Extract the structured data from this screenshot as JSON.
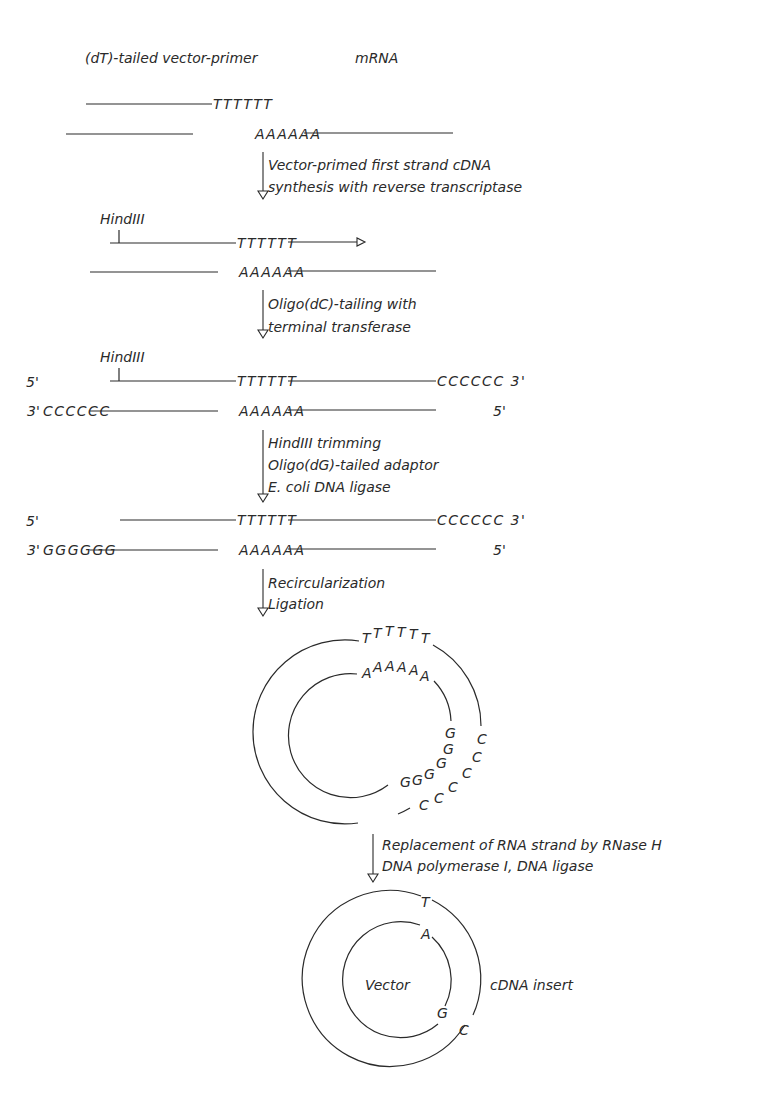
{
  "diagram": {
    "type": "molecular-cloning-scheme",
    "headers": {
      "left": "(dT)-tailed vector-primer",
      "right": "mRNA"
    },
    "stage1": {
      "top_seq": "TTTTTT",
      "bottom_seq": "AAAAAA"
    },
    "step1": {
      "line1": "Vector-primed first strand cDNA",
      "line2": "synthesis with reverse transcriptase"
    },
    "stage2": {
      "site": "HindIII",
      "top_seq": "TTTTTT",
      "bottom_seq": "AAAAAA"
    },
    "step2": {
      "line1": "Oligo(dC)-tailing with",
      "line2": "terminal transferase"
    },
    "stage3": {
      "site": "HindIII",
      "top_left_end": "5'",
      "top_seq": "TTTTTT",
      "top_tail": "CCCCCC 3'",
      "bottom_left_end": "3'",
      "bottom_tail": "CCCCCC",
      "bottom_seq": "AAAAAA",
      "bottom_right_end": "5'"
    },
    "step3": {
      "line1": "HindIII trimming",
      "line2": "Oligo(dG)-tailed adaptor",
      "line3": "E. coli DNA ligase"
    },
    "stage4": {
      "top_left_end": "5'",
      "top_seq": "TTTTTT",
      "top_tail": "CCCCCC 3'",
      "bottom_left_end": "3'",
      "bottom_tail": "GGGGGG",
      "bottom_seq": "AAAAAA",
      "bottom_right_end": "5'"
    },
    "step4": {
      "line1": "Recircularization",
      "line2": "Ligation"
    },
    "circle1": {
      "outer_letters": [
        "T",
        "T",
        "T",
        "T",
        "T",
        "T"
      ],
      "inner_letters": [
        "A",
        "A",
        "A",
        "A",
        "A",
        "A"
      ],
      "inner_g_letters": [
        "G",
        "G",
        "G",
        "G",
        "G",
        "G"
      ],
      "outer_c_letters": [
        "C",
        "C",
        "C",
        "C",
        "C",
        "C"
      ]
    },
    "step5": {
      "line1": "Replacement of RNA strand by RNase H",
      "line2": "DNA polymerase I, DNA ligase"
    },
    "circle2": {
      "outer_top": "T",
      "inner_top": "A",
      "inner_bottom": "G",
      "outer_bottom": "C",
      "center_label": "Vector",
      "side_label": "cDNA insert"
    }
  }
}
